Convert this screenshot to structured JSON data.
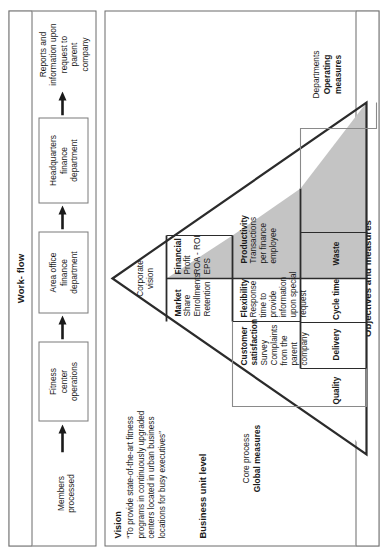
{
  "figure": {
    "type": "performance-pyramid",
    "orientation": "rotated-90-ccw"
  },
  "workflow": {
    "panel_label": "Work-\nflow",
    "panel_label_line1": "Work-",
    "panel_label_line2": "flow",
    "start_label": "Members\nprocessed",
    "end_label": "Reports and\ninformation upon\nrequest to\nparent\ncompany",
    "boxes": [
      {
        "id": "fitness-center-operations",
        "label": "Fitness\ncenter\noperations"
      },
      {
        "id": "area-office-finance-department",
        "label": "Area office\nfinance\ndepartment"
      },
      {
        "id": "headquarters-finance-department",
        "label": "Headquarters\nfinance\ndepartment"
      }
    ],
    "arrow_count": 4
  },
  "measures": {
    "panel_label": "Objectives and measures",
    "vision": {
      "title": "Vision",
      "text": "“To provide state-of-the-art fitness programs in continuously upgraded centers located in urban business locations for busy executives”"
    },
    "business_unit_level": "Business unit level",
    "apex": {
      "label": "Corporate\nvision",
      "line1": "Corporate",
      "line2": "vision"
    },
    "left_tier_labels": [
      {
        "id": "core-process-global-measures",
        "line1": "Core",
        "line2": "process",
        "bold": "Global measures"
      },
      {
        "id": "departments-operating-measures",
        "line1": "Departments",
        "bold1": "Operating",
        "bold2": "measures"
      }
    ],
    "tier2": [
      {
        "id": "market",
        "title": "Market",
        "items": [
          "Share",
          "Enrollments",
          "Retention"
        ],
        "shaded": false
      },
      {
        "id": "financial",
        "title": "Financial",
        "items": [
          "Profit",
          "ROA - ROI",
          "EPS"
        ],
        "shaded": true
      }
    ],
    "tier3": [
      {
        "id": "customer-satisfaction",
        "title": "Customer\nsatisfaction",
        "title_line1": "Customer",
        "title_line2": "satisfaction",
        "items": [
          "Survey",
          "Complaints",
          "from the parent",
          "company"
        ],
        "shaded": false
      },
      {
        "id": "flexibility",
        "title": "Flexibility",
        "items": [
          "Response time to",
          "provide information",
          "upon special",
          "request"
        ],
        "shaded": false
      },
      {
        "id": "productivity",
        "title": "Productivity",
        "items": [
          "Transactions",
          "per finance",
          "employee"
        ],
        "shaded": true
      }
    ],
    "tier4": [
      {
        "id": "quality",
        "label": "Quality",
        "shaded": false
      },
      {
        "id": "delivery",
        "label": "Delivery",
        "shaded": false
      },
      {
        "id": "cycle-time",
        "label": "Cycle time",
        "shaded": true
      },
      {
        "id": "waste",
        "label": "Waste",
        "shaded": true
      }
    ]
  },
  "colors": {
    "shade_fill": "#c4c4c4",
    "line": "#2b2b2b",
    "panel_border": "#6b6b6b",
    "text": "#1a1a1a",
    "background": "#ffffff"
  }
}
